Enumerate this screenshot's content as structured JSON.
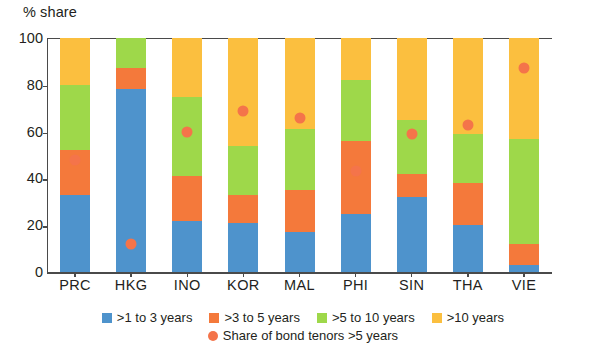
{
  "chart_data": {
    "type": "bar",
    "title": "",
    "ylabel": "% share",
    "xlabel": "",
    "ylim": [
      0,
      100
    ],
    "yticks": [
      0,
      20,
      40,
      60,
      80,
      100
    ],
    "grid": false,
    "stacked": true,
    "legend_position": "bottom",
    "categories": [
      "PRC",
      "HKG",
      "INO",
      "KOR",
      "MAL",
      "PHI",
      "SIN",
      "THA",
      "VIE"
    ],
    "series": [
      {
        "name": ">1 to 3 years",
        "color": "#4e93cc",
        "values": [
          33,
          78,
          22,
          21,
          17,
          25,
          32,
          20,
          3
        ]
      },
      {
        "name": ">3 to 5 years",
        "color": "#f4793b",
        "values": [
          19,
          9,
          19,
          12,
          18,
          31,
          10,
          18,
          9
        ]
      },
      {
        "name": ">5 to 10 years",
        "color": "#9ed84a",
        "values": [
          28,
          13,
          34,
          21,
          26,
          26,
          23,
          21,
          45
        ]
      },
      {
        "name": ">10 years",
        "color": "#fbbf3f",
        "values": [
          20,
          0,
          25,
          46,
          39,
          18,
          35,
          41,
          43
        ]
      }
    ],
    "overlay": {
      "name": "Share of bond tenors >5 years",
      "color": "#f4744a",
      "marker": "circle",
      "values": [
        48,
        12,
        60,
        69,
        66,
        43,
        59,
        63,
        87
      ]
    }
  },
  "legend": {
    "row1": [
      {
        "label": ">1 to 3 years",
        "color": "#4e93cc",
        "shape": "square"
      },
      {
        "label": ">3 to 5 years",
        "color": "#f4793b",
        "shape": "square"
      },
      {
        "label": ">5 to 10 years",
        "color": "#9ed84a",
        "shape": "square"
      },
      {
        "label": ">10 years",
        "color": "#fbbf3f",
        "shape": "square"
      }
    ],
    "row2": [
      {
        "label": "Share of bond tenors >5 years",
        "color": "#f4744a",
        "shape": "circle"
      }
    ]
  }
}
